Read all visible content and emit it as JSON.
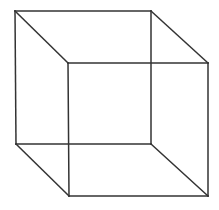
{
  "diagram": {
    "type": "wireframe-cube",
    "name": "Necker cube",
    "stroke_color": "#333333",
    "stroke_width": 1.5,
    "background": "#ffffff",
    "vertices": {
      "back_top_left": [
        15,
        11
      ],
      "back_top_right": [
        151,
        11
      ],
      "back_bottom_left": [
        16,
        144
      ],
      "back_bottom_right": [
        151,
        144
      ],
      "front_top_left": [
        68,
        63
      ],
      "front_top_right": [
        208,
        63
      ],
      "front_bottom_left": [
        69,
        196
      ],
      "front_bottom_right": [
        208,
        196
      ]
    },
    "edges": [
      [
        "back_top_left",
        "back_top_right"
      ],
      [
        "back_top_right",
        "back_bottom_right"
      ],
      [
        "back_bottom_right",
        "back_bottom_left"
      ],
      [
        "back_bottom_left",
        "back_top_left"
      ],
      [
        "front_top_left",
        "front_top_right"
      ],
      [
        "front_top_right",
        "front_bottom_right"
      ],
      [
        "front_bottom_right",
        "front_bottom_left"
      ],
      [
        "front_bottom_left",
        "front_top_left"
      ],
      [
        "back_top_left",
        "front_top_left"
      ],
      [
        "back_top_right",
        "front_top_right"
      ],
      [
        "back_bottom_left",
        "front_bottom_left"
      ],
      [
        "back_bottom_right",
        "front_bottom_right"
      ]
    ]
  }
}
